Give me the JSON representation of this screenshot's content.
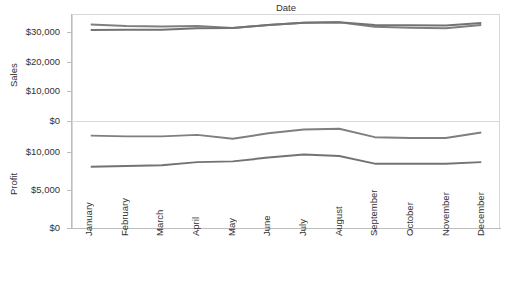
{
  "header": {
    "column_title": "Date"
  },
  "axes": {
    "sales": {
      "title": "Sales",
      "ticks": [
        "$30,000",
        "$20,000",
        "$10,000",
        "$0"
      ],
      "tick_values": [
        30000,
        20000,
        10000,
        0
      ],
      "range": [
        0,
        36000
      ]
    },
    "profit": {
      "title": "Profit",
      "ticks": [
        "$10,000",
        "$5,000",
        "$0"
      ],
      "tick_values": [
        10000,
        5000,
        0
      ],
      "range": [
        0,
        14000
      ]
    }
  },
  "colors": {
    "line_upper": "#7f7f7f",
    "line_lower": "#737373",
    "border": "#d8d8d8",
    "axis": "#bdbdbd",
    "text": "#333333"
  },
  "chart_data": [
    {
      "type": "line",
      "title": "Date",
      "xlabel": "Date",
      "ylabel": "Sales",
      "ylim": [
        0,
        36000
      ],
      "grid": false,
      "legend": "none",
      "categories": [
        "January",
        "February",
        "March",
        "April",
        "May",
        "June",
        "July",
        "August",
        "September",
        "October",
        "November",
        "December"
      ],
      "series": [
        {
          "name": "Sales A",
          "values": [
            32800,
            32300,
            32100,
            32300,
            31600,
            32600,
            33400,
            33500,
            32000,
            31700,
            31500,
            32600
          ]
        },
        {
          "name": "Sales B",
          "values": [
            30900,
            31000,
            31000,
            31500,
            31600,
            32600,
            33400,
            33500,
            32600,
            32500,
            32400,
            33300
          ]
        }
      ]
    },
    {
      "type": "line",
      "title": "",
      "xlabel": "Date",
      "ylabel": "Profit",
      "ylim": [
        0,
        14000
      ],
      "grid": false,
      "legend": "none",
      "categories": [
        "January",
        "February",
        "March",
        "April",
        "May",
        "June",
        "July",
        "August",
        "September",
        "October",
        "November",
        "December"
      ],
      "series": [
        {
          "name": "Profit A",
          "values": [
            12200,
            12100,
            12100,
            12300,
            11800,
            12500,
            13000,
            13100,
            12000,
            11900,
            11900,
            12600
          ]
        },
        {
          "name": "Profit B",
          "values": [
            8100,
            8200,
            8300,
            8700,
            8800,
            9300,
            9700,
            9500,
            8500,
            8500,
            8500,
            8700
          ]
        }
      ]
    }
  ],
  "xaxis": {
    "categories": [
      "January",
      "February",
      "March",
      "April",
      "May",
      "June",
      "July",
      "August",
      "September",
      "October",
      "November",
      "December"
    ]
  }
}
